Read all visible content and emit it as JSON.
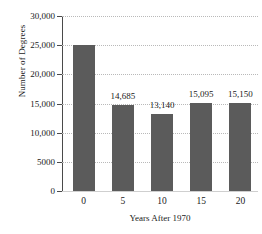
{
  "chart_data": {
    "type": "bar",
    "title": "",
    "xlabel": "Years After 1970",
    "ylabel": "Number of Degrees",
    "categories": [
      "0",
      "5",
      "10",
      "15",
      "20"
    ],
    "values": [
      25000,
      14685,
      13140,
      15095,
      15150
    ],
    "data_labels": [
      "",
      "14,685",
      "13,140",
      "15,095",
      "15,150"
    ],
    "ylim": [
      0,
      30000
    ],
    "ytick_values": [
      0,
      5000,
      10000,
      15000,
      20000,
      25000,
      30000
    ],
    "ytick_labels": [
      "0",
      "5000",
      "10,000",
      "15,000",
      "20,000",
      "25,000",
      "30,000"
    ],
    "grid": true,
    "legend": "none",
    "bar_color": "#5b5b5b",
    "gridline_color": "#b9b9b9",
    "axis_color": "#4a4a4a"
  }
}
